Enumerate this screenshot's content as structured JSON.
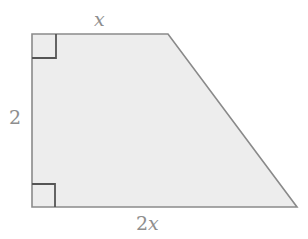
{
  "figure": {
    "kind": "right-trapezoid",
    "background_color": "#ffffff",
    "fill_color": "#ededed",
    "stroke_color": "#8a8a8a",
    "label_color": "#8e8e8e",
    "marker_color": "#555555",
    "vertices": {
      "top_left": [
        32,
        34
      ],
      "top_right": [
        168,
        34
      ],
      "bottom_right": [
        297,
        207
      ],
      "bottom_left": [
        32,
        207
      ]
    },
    "right_angle_markers": [
      {
        "at": "top-left",
        "size": 24
      },
      {
        "at": "bottom-left",
        "size": 23
      }
    ],
    "labels": {
      "top_side": "x",
      "left_side": "2",
      "bottom_side_coefficient": "2",
      "bottom_side_variable": "x"
    }
  }
}
